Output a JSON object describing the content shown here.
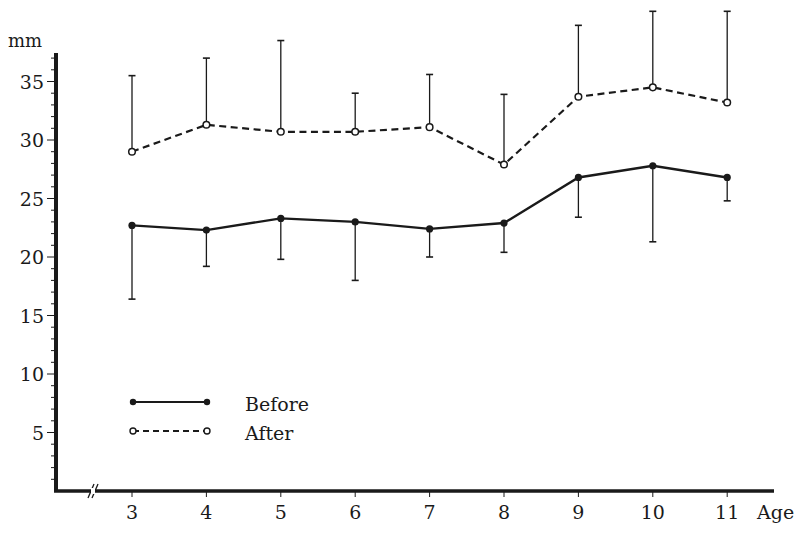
{
  "chart_data": {
    "type": "line",
    "title": "",
    "xlabel": "Age",
    "ylabel": "mm",
    "x": [
      3,
      4,
      5,
      6,
      7,
      8,
      9,
      10,
      11
    ],
    "xticks": [
      "3",
      "4",
      "5",
      "6",
      "7",
      "8",
      "9",
      "10",
      "11"
    ],
    "yticks": [
      "5",
      "10",
      "15",
      "20",
      "25",
      "30",
      "35"
    ],
    "ylim": [
      0,
      37.5
    ],
    "grid": false,
    "axis_break": "x",
    "legend_position": "lower-left inside plot",
    "series": [
      {
        "name": "Before",
        "style": "solid line, filled circle markers",
        "values": [
          22.7,
          22.3,
          23.3,
          23.0,
          22.4,
          22.9,
          26.8,
          27.8,
          26.8
        ],
        "error_direction": "down",
        "error_ends": [
          16.4,
          19.2,
          19.8,
          18.0,
          20.0,
          20.4,
          23.4,
          21.3,
          24.8
        ]
      },
      {
        "name": "After",
        "style": "dashed line, open circle markers",
        "values": [
          29.0,
          31.3,
          30.7,
          30.7,
          31.1,
          27.9,
          33.7,
          34.5,
          33.2
        ],
        "error_direction": "up",
        "error_ends": [
          35.5,
          37.0,
          38.5,
          34.0,
          35.6,
          33.9,
          39.8,
          41.0,
          41.0
        ]
      }
    ]
  },
  "labels": {
    "y_unit": "mm",
    "x_unit": "Age",
    "legend_before": "Before",
    "legend_after": "After"
  },
  "colors": {
    "ink": "#1a1a1a",
    "background": "#ffffff"
  }
}
